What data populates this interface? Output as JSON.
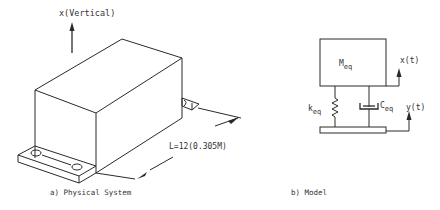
{
  "physical_system": {
    "axis_label": "x(Vertical)",
    "dimension_label": "L=12(0.305M)",
    "caption": "a)  Physical System"
  },
  "model": {
    "mass_label_main": "M",
    "mass_label_sub": "eq",
    "spring_label_main": "k",
    "spring_label_sub": "eq",
    "damper_label_main": "C",
    "damper_label_sub": "eq",
    "mass_displacement_label": "x(t)",
    "base_displacement_label": "y(t)",
    "caption": "b) Model"
  }
}
